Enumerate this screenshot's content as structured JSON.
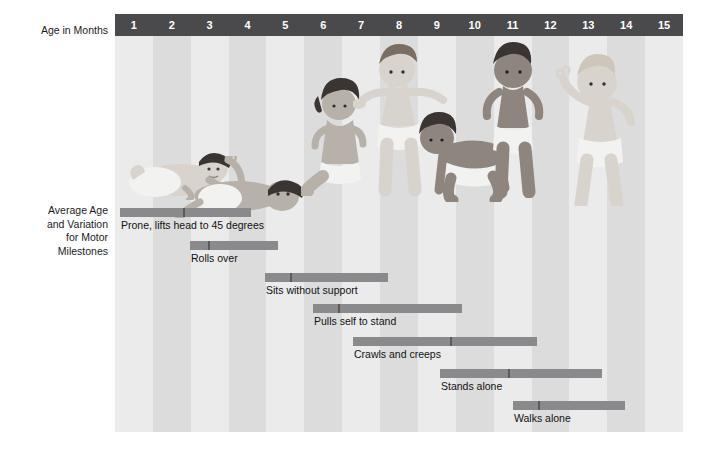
{
  "axes": {
    "age_label": "Age in Months",
    "milestones_label": "Average Age\nand Variation\nfor Motor\nMilestones"
  },
  "colors": {
    "header_bar": "#4a4a4c",
    "stripe_light": "#ebebeb",
    "stripe_dark": "#dcdcdc",
    "milestone_bar": "#8a8a8c",
    "milestone_tick": "#5a5a5c",
    "text": "#111111",
    "header_text": "#ffffff",
    "page_background": "#ffffff"
  },
  "chart_data": {
    "type": "bar",
    "title": "Average Age and Variation for Motor Milestones",
    "xlabel": "Age in Months",
    "ylabel": "Average Age and Variation for Motor Milestones",
    "xlim": [
      0.5,
      15.5
    ],
    "grid": "vertical alternating month stripes",
    "legend": "none",
    "orientation": "horizontal",
    "categories": [
      "Prone, lifts head to 45 degrees",
      "Rolls over",
      "Sits without support",
      "Pulls self to stand",
      "Crawls and creeps",
      "Stands alone",
      "Walks alone"
    ],
    "tick_labels": [
      "1",
      "2",
      "3",
      "4",
      "5",
      "6",
      "7",
      "8",
      "9",
      "10",
      "11",
      "12",
      "13",
      "14",
      "15"
    ],
    "series": [
      {
        "name": "Prone, lifts head to 45 degrees",
        "range_start_months": 0.9,
        "average_months": 2.0,
        "range_end_months": 4.5
      },
      {
        "name": "Rolls over",
        "range_start_months": 2.9,
        "average_months": 3.4,
        "range_end_months": 5.3
      },
      {
        "name": "Sits without support",
        "range_start_months": 4.9,
        "average_months": 5.6,
        "range_end_months": 8.3
      },
      {
        "name": "Pulls self to stand",
        "range_start_months": 6.3,
        "average_months": 7.0,
        "range_end_months": 10.4
      },
      {
        "name": "Crawls and creeps",
        "range_start_months": 7.2,
        "average_months": 9.9,
        "range_end_months": 12.3
      },
      {
        "name": "Stands alone",
        "range_start_months": 9.4,
        "average_months": 11.3,
        "range_end_months": 14.5
      },
      {
        "name": "Walks alone",
        "range_start_months": 11.4,
        "average_months": 12.1,
        "range_end_months": 14.6
      }
    ]
  },
  "milestones": [
    {
      "label": "Prone, lifts head to 45 degrees",
      "bar_left": 5,
      "bar_width": 131,
      "tick_offset": 63,
      "row_top": 172
    },
    {
      "label": "Rolls over",
      "bar_left": 75,
      "bar_width": 88,
      "tick_offset": 18,
      "row_top": 205
    },
    {
      "label": "Sits without support",
      "bar_left": 150,
      "bar_width": 123,
      "tick_offset": 25,
      "row_top": 237
    },
    {
      "label": "Pulls self to stand",
      "bar_left": 198,
      "bar_width": 149,
      "tick_offset": 25,
      "row_top": 268
    },
    {
      "label": "Crawls and creeps",
      "bar_left": 238,
      "bar_width": 184,
      "tick_offset": 97,
      "row_top": 301
    },
    {
      "label": "Stands alone",
      "bar_left": 325,
      "bar_width": 162,
      "tick_offset": 68,
      "row_top": 333
    },
    {
      "label": "Walks alone",
      "bar_left": 398,
      "bar_width": 112,
      "tick_offset": 25,
      "row_top": 365
    }
  ],
  "illustration": {
    "description": "Grayscale illustrations of infants demonstrating each motor milestone across the month axis",
    "figures": [
      {
        "name": "infant-prone-lifting-head",
        "left": 10,
        "top": 100,
        "width": 120,
        "height": 64
      },
      {
        "name": "infant-rolling-over",
        "left": 55,
        "top": 120,
        "width": 140,
        "height": 62
      },
      {
        "name": "infant-sitting-unsupported",
        "left": 186,
        "top": 42,
        "width": 76,
        "height": 118
      },
      {
        "name": "infant-pulling-to-stand",
        "left": 238,
        "top": 8,
        "width": 96,
        "height": 156
      },
      {
        "name": "infant-crawling",
        "left": 300,
        "top": 74,
        "width": 104,
        "height": 92
      },
      {
        "name": "infant-standing-alone",
        "left": 360,
        "top": 6,
        "width": 74,
        "height": 156
      },
      {
        "name": "infant-walking-alone",
        "left": 430,
        "top": 18,
        "width": 92,
        "height": 152
      }
    ]
  }
}
